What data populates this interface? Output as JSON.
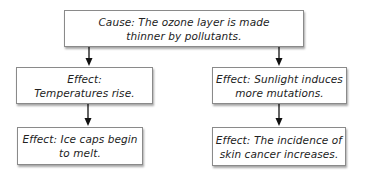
{
  "diagram": {
    "type": "cause-effect flowchart",
    "cause": {
      "lines": [
        "Cause: The ozone layer is made",
        "thinner by pollutants."
      ]
    },
    "branches": [
      {
        "effects": [
          {
            "lines": [
              "Effect:",
              "Temperatures rise."
            ]
          },
          {
            "lines": [
              "Effect: Ice caps begin",
              "to melt."
            ]
          }
        ]
      },
      {
        "effects": [
          {
            "lines": [
              "Effect: Sunlight induces",
              "more mutations."
            ]
          },
          {
            "lines": [
              "Effect: The incidence of",
              "skin cancer increases."
            ]
          }
        ]
      }
    ],
    "colors": {
      "border": "#8a8a8a",
      "text": "#222222",
      "arrow": "#111111"
    }
  }
}
